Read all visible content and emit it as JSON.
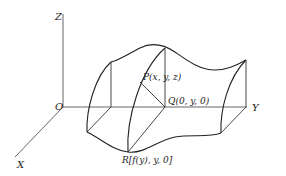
{
  "diagram": {
    "axes": {
      "z_label": "Z",
      "y_label": "Y",
      "x_label": "X",
      "origin_label": "O"
    },
    "points": {
      "P": {
        "label": "P(x, y, z)"
      },
      "Q": {
        "label": "Q(0, y, 0)"
      },
      "R": {
        "label": "R[f(y), y, 0]"
      }
    },
    "colors": {
      "line": "#222222",
      "axis": "#555555",
      "background": "#ffffff"
    }
  }
}
